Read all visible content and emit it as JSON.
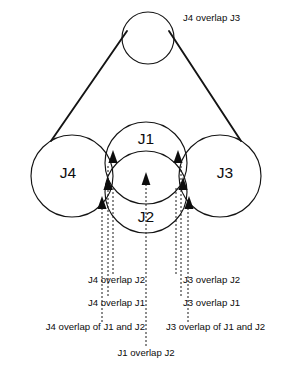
{
  "diagram": {
    "title_label": "J4 overlap J3",
    "circles": [
      {
        "name": "top-circle",
        "label": "",
        "cx": 148,
        "cy": 38,
        "r": 26
      },
      {
        "name": "j4-circle",
        "label": "J4",
        "cx": 72,
        "cy": 176,
        "r": 41,
        "label_x": 68,
        "label_y": 174
      },
      {
        "name": "j3-circle",
        "label": "J3",
        "cx": 220,
        "cy": 176,
        "r": 41,
        "label_x": 225,
        "label_y": 174
      },
      {
        "name": "j1-circle",
        "label": "J1",
        "cx": 146,
        "cy": 163,
        "r": 41,
        "label_x": 146,
        "label_y": 140
      },
      {
        "name": "j2-circle",
        "label": "J2",
        "cx": 146,
        "cy": 192,
        "r": 41,
        "label_x": 146,
        "label_y": 218
      }
    ],
    "tangents": [
      {
        "name": "left-tangent",
        "x1": 127,
        "y1": 31,
        "x2": 51,
        "y2": 141
      },
      {
        "name": "right-tangent",
        "x1": 169,
        "y1": 31,
        "x2": 241,
        "y2": 141
      }
    ],
    "top_label": {
      "text": "J4 overlap J3",
      "x": 183,
      "y": 21
    },
    "callouts": [
      {
        "name": "j4-overlap-j2",
        "text": "J4 overlap J2",
        "text_x": 145,
        "text_y": 283,
        "align": "end",
        "line_x": 113,
        "line_top": 188,
        "line_bottom": 275,
        "arrow_x": 113,
        "arrow_y": 186
      },
      {
        "name": "j4-overlap-j1",
        "text": "J4 overlap J1",
        "text_x": 145,
        "text_y": 306,
        "align": "end",
        "line_x": 108,
        "line_top": 166,
        "line_bottom": 298,
        "arrow_x": 108,
        "arrow_y": 164
      },
      {
        "name": "j4-overlap-of-j1-and-j2",
        "text": "J4 overlap of J1 and J2",
        "text_x": 145,
        "text_y": 330,
        "align": "end",
        "line_x": 102,
        "line_top": 208,
        "line_bottom": 322,
        "arrow_x": 102,
        "arrow_y": 206
      },
      {
        "name": "j3-overlap-j2",
        "text": "J3 overlap J2",
        "text_x": 183,
        "text_y": 283,
        "align": "start",
        "line_x": 176,
        "line_top": 188,
        "line_bottom": 275,
        "arrow_x": 176,
        "arrow_y": 186
      },
      {
        "name": "j3-overlap-j1",
        "text": "J3 overlap J1",
        "text_x": 183,
        "text_y": 306,
        "align": "start",
        "line_x": 181,
        "line_top": 166,
        "line_bottom": 298,
        "arrow_x": 181,
        "arrow_y": 164
      },
      {
        "name": "j3-overlap-of-j1-and-j2",
        "text": "J3 overlap of J1 and J2",
        "text_x": 166,
        "text_y": 330,
        "align": "start",
        "line_x": 188,
        "line_top": 208,
        "line_bottom": 322,
        "arrow_x": 188,
        "arrow_y": 206
      },
      {
        "name": "j1-overlap-j2",
        "text": "J1 overlap J2",
        "text_x": 146,
        "text_y": 356,
        "align": "middle",
        "line_x": 146,
        "line_top": 180,
        "line_bottom": 348,
        "arrow_x": 146,
        "arrow_y": 178
      }
    ],
    "colors": {
      "stroke": "#141414",
      "text": "#0d0d0d",
      "background": "#ffffff"
    }
  }
}
